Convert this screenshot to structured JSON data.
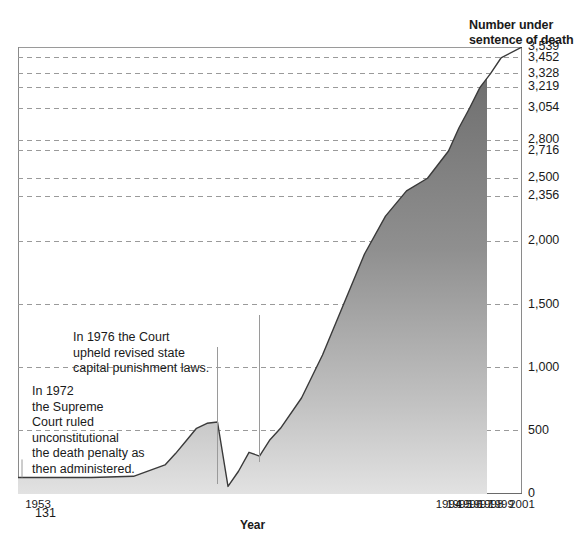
{
  "chart_data": {
    "type": "area",
    "title": "",
    "ylabel": "Number under sentence of death",
    "xlabel": "Year",
    "grid": true,
    "legend": "none",
    "xlim": [
      1953,
      2001
    ],
    "ylim": [
      0,
      3539
    ],
    "x_tick_labels": [
      "1953",
      "1994",
      "1995",
      "1996",
      "1997",
      "1998",
      "1999",
      "2001"
    ],
    "x_tick_values": [
      1953,
      1994,
      1995,
      1996,
      1997,
      1998,
      1999,
      2001
    ],
    "y_tick_labels": [
      "3,539",
      "3,452",
      "3,328",
      "3,219",
      "3,054",
      "2,800",
      "2,716",
      "2,500",
      "2,356",
      "2,000",
      "1,500",
      "1,000",
      "500",
      "0"
    ],
    "y_tick_values": [
      3539,
      3452,
      3328,
      3219,
      3054,
      2800,
      2716,
      2500,
      2356,
      2000,
      1500,
      1000,
      500,
      0
    ],
    "series": [
      {
        "name": "Number under sentence of death",
        "x": [
          1953,
          1960,
          1964,
          1967,
          1968,
          1969,
          1970,
          1971,
          1972,
          1973,
          1974,
          1975,
          1976,
          1977,
          1978,
          1980,
          1982,
          1984,
          1986,
          1988,
          1990,
          1992,
          1994,
          1995,
          1996,
          1997,
          1998,
          1999,
          2001
        ],
        "values": [
          131,
          131,
          140,
          230,
          320,
          420,
          520,
          560,
          570,
          60,
          180,
          330,
          300,
          430,
          520,
          760,
          1100,
          1500,
          1900,
          2200,
          2400,
          2500,
          2716,
          2900,
          3054,
          3219,
          3328,
          3452,
          3539
        ]
      }
    ],
    "data_labels": [
      {
        "text": "131",
        "x": 1953,
        "y": 131
      }
    ],
    "annotations": [
      {
        "id": "annot-1976",
        "text": "In 1976 the Court\nupheld revised state\ncapital punishment laws.",
        "points_to_year": 1976
      },
      {
        "id": "annot-1972",
        "text": "In 1972\nthe Supreme\nCourt ruled\nunconstitutional\nthe death penalty as\nthen administered.",
        "points_to_year": 1972
      }
    ],
    "colors": {
      "area_fill_top": "#6e6e6e",
      "area_fill_bottom": "#d9d9d9",
      "line": "#3a3a3a",
      "grid": "#9a9a9a",
      "axis": "#8a8a8a",
      "text": "#1a1a1a",
      "background": "#ffffff"
    }
  },
  "ytitle": {
    "line1": "Number under",
    "line2": "sentence of death"
  },
  "xtitle": "Year"
}
